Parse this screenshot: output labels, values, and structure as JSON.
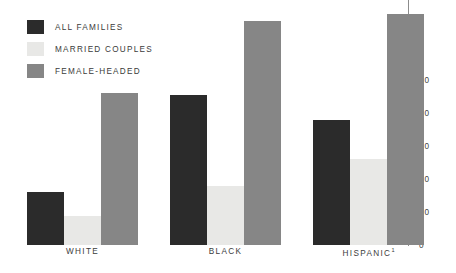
{
  "legend": {
    "items": [
      {
        "label": "ALL FAMILIES",
        "color": "#2b2b2b",
        "key": "all_families"
      },
      {
        "label": "MARRIED COUPLES",
        "color": "#e8e8e6",
        "key": "married_couples"
      },
      {
        "label": "FEMALE-HEADED",
        "color": "#868686",
        "key": "female_headed"
      }
    ]
  },
  "axis": {
    "ticks": [
      "0",
      "10",
      "20",
      "30",
      "40",
      "50"
    ]
  },
  "groups": [
    {
      "label": "WHITE",
      "footnote": ""
    },
    {
      "label": "BLACK",
      "footnote": ""
    },
    {
      "label": "HISPANIC",
      "footnote": "1"
    }
  ],
  "chart_data": {
    "type": "bar",
    "title": "",
    "xlabel": "",
    "ylabel": "",
    "categories": [
      "WHITE",
      "BLACK",
      "HISPANIC"
    ],
    "series": [
      {
        "name": "ALL FAMILIES",
        "color": "#2b2b2b",
        "values": [
          16,
          45.5,
          38
        ]
      },
      {
        "name": "MARRIED COUPLES",
        "color": "#e8e8e6",
        "values": [
          8.8,
          18,
          26
        ]
      },
      {
        "name": "FEMALE-HEADED",
        "color": "#868686",
        "values": [
          46,
          68,
          70
        ]
      }
    ],
    "ylim": [
      0,
      50
    ],
    "yticks": [
      0,
      10,
      20,
      30,
      40,
      50
    ],
    "grid": false,
    "legend_position": "top-left",
    "annotations": [
      "HISPANIC label carries superscript footnote marker 1"
    ]
  }
}
